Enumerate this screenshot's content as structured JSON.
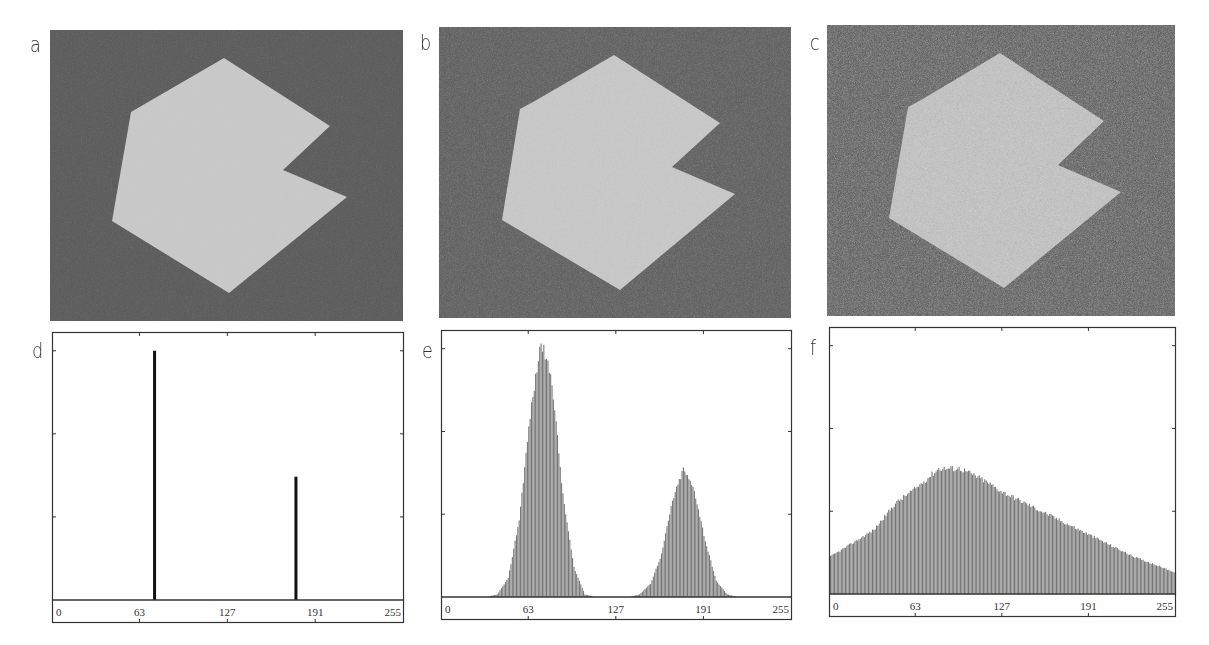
{
  "figure": {
    "panels": [
      {
        "id": "a",
        "label": "a",
        "type": "image",
        "description": "Polygon on dark background, low noise",
        "noise": "low"
      },
      {
        "id": "b",
        "label": "b",
        "type": "image",
        "description": "Polygon on dark background, medium noise",
        "noise": "medium"
      },
      {
        "id": "c",
        "label": "c",
        "type": "image",
        "description": "Polygon on dark background, high noise",
        "noise": "high"
      },
      {
        "id": "d",
        "label": "d",
        "type": "histogram"
      },
      {
        "id": "e",
        "label": "e",
        "type": "histogram"
      },
      {
        "id": "f",
        "label": "f",
        "type": "histogram"
      }
    ],
    "colors": {
      "background_dark": "#575757",
      "polygon_light": "#c9c9c9",
      "hist_fill": "#777777",
      "hist_spike": "#111111",
      "frame": "#333333"
    }
  },
  "chart_data": [
    {
      "panel": "d",
      "type": "bar",
      "title": "",
      "xlabel": "",
      "ylabel": "",
      "xlim": [
        0,
        255
      ],
      "ylim": [
        0,
        1
      ],
      "x_ticks": [
        0,
        63,
        127,
        191,
        255
      ],
      "x_tick_labels": [
        "0",
        "63",
        "127",
        "191",
        "255"
      ],
      "grid": false,
      "series": [
        {
          "name": "histogram",
          "x": [
            74,
            177
          ],
          "values": [
            0.93,
            0.46
          ]
        }
      ]
    },
    {
      "panel": "e",
      "type": "bar",
      "title": "",
      "xlabel": "",
      "ylabel": "",
      "xlim": [
        0,
        255
      ],
      "ylim": [
        0,
        1
      ],
      "x_ticks": [
        0,
        63,
        127,
        191,
        255
      ],
      "x_tick_labels": [
        "0",
        "63",
        "127",
        "191",
        "255"
      ],
      "grid": false,
      "series": [
        {
          "name": "histogram",
          "x": [
            0,
            8,
            16,
            24,
            32,
            40,
            48,
            56,
            64,
            72,
            80,
            88,
            96,
            104,
            112,
            120,
            128,
            136,
            144,
            152,
            160,
            168,
            176,
            184,
            192,
            200,
            208,
            216,
            224,
            232,
            240,
            248,
            255
          ],
          "values": [
            0,
            0,
            0,
            0,
            0,
            0.01,
            0.07,
            0.29,
            0.68,
            0.96,
            0.81,
            0.38,
            0.11,
            0.01,
            0,
            0,
            0,
            0,
            0.01,
            0.05,
            0.16,
            0.36,
            0.48,
            0.4,
            0.21,
            0.06,
            0.01,
            0,
            0,
            0,
            0,
            0,
            0
          ]
        }
      ],
      "peaks": [
        {
          "x": 73,
          "value": 0.96
        },
        {
          "x": 177,
          "value": 0.48
        }
      ]
    },
    {
      "panel": "f",
      "type": "bar",
      "title": "",
      "xlabel": "",
      "ylabel": "",
      "xlim": [
        0,
        255
      ],
      "ylim": [
        0,
        1
      ],
      "x_ticks": [
        0,
        63,
        127,
        191,
        255
      ],
      "x_tick_labels": [
        "0",
        "63",
        "127",
        "191",
        "255"
      ],
      "grid": false,
      "series": [
        {
          "name": "histogram",
          "x": [
            0,
            16,
            32,
            48,
            64,
            80,
            96,
            112,
            128,
            144,
            160,
            176,
            192,
            208,
            224,
            240,
            255
          ],
          "values": [
            0.14,
            0.19,
            0.24,
            0.34,
            0.4,
            0.47,
            0.47,
            0.43,
            0.38,
            0.34,
            0.3,
            0.26,
            0.22,
            0.18,
            0.14,
            0.11,
            0.08
          ]
        }
      ],
      "peaks": [
        {
          "x": 85,
          "value": 0.48
        }
      ]
    }
  ]
}
